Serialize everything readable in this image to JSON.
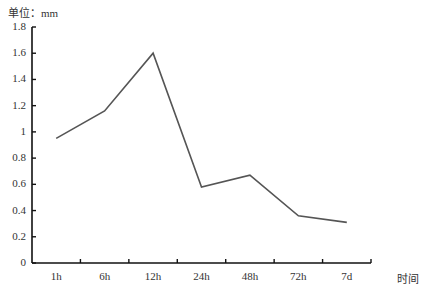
{
  "chart_data": {
    "type": "line",
    "title": "",
    "unit_label": "单位：mm",
    "xlabel": "时间",
    "ylabel": "单位：mm",
    "categories": [
      "1h",
      "6h",
      "12h",
      "24h",
      "48h",
      "72h",
      "7d"
    ],
    "series": [
      {
        "name": "",
        "values": [
          0.95,
          1.16,
          1.6,
          0.58,
          0.67,
          0.36,
          0.31
        ],
        "color": "#555555"
      }
    ],
    "ylim": [
      0,
      1.8
    ],
    "yticks": [
      "0",
      "0.2",
      "0.4",
      "0.6",
      "0.8",
      "1",
      "1.2",
      "1.4",
      "1.6",
      "1.8"
    ],
    "grid": false,
    "legend": "none"
  }
}
